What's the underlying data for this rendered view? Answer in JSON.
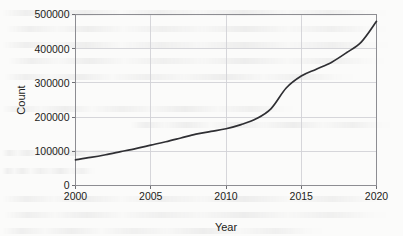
{
  "chart_data": {
    "type": "line",
    "title": "",
    "xlabel": "Year",
    "ylabel": "Count",
    "xlim": [
      2000,
      2020
    ],
    "ylim": [
      0,
      500000
    ],
    "grid": true,
    "legend": null,
    "xticks": [
      2000,
      2005,
      2010,
      2015,
      2020
    ],
    "xtick_labels": [
      "2000",
      "2005",
      "2010",
      "2015",
      "2020"
    ],
    "yticks": [
      0,
      100000,
      200000,
      300000,
      400000,
      500000
    ],
    "ytick_labels": [
      "0",
      "100000",
      "200000",
      "300000",
      "400000",
      "500000"
    ],
    "series": [
      {
        "name": "Count",
        "color": "#2f2f33",
        "x": [
          2000,
          2001,
          2002,
          2003,
          2004,
          2005,
          2006,
          2007,
          2008,
          2009,
          2010,
          2011,
          2012,
          2013,
          2014,
          2015,
          2016,
          2017,
          2018,
          2019,
          2020
        ],
        "values": [
          75000,
          82000,
          90000,
          99000,
          108000,
          118000,
          128000,
          139000,
          150000,
          158000,
          166000,
          178000,
          195000,
          225000,
          285000,
          320000,
          340000,
          360000,
          388000,
          420000,
          480000
        ]
      }
    ]
  },
  "axes": {
    "y_title": "Count",
    "x_title": "Year"
  }
}
